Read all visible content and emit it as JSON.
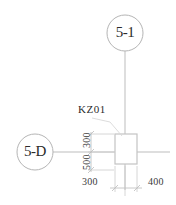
{
  "drawing": {
    "title": "Structural column grid detail",
    "colors": {
      "line": "#b9b9b9",
      "line_light": "#cfcfcf",
      "text": "#2b2b2b",
      "background": "#ffffff"
    },
    "grid_bubbles": [
      {
        "id": "top",
        "label": "5-1",
        "axis": "vertical"
      },
      {
        "id": "left",
        "label": "5-D",
        "axis": "horizontal"
      }
    ],
    "column": {
      "tag": "KZ01",
      "shape": "square"
    },
    "dimensions": {
      "vertical": [
        {
          "value": "300",
          "position": "above-axis"
        },
        {
          "value": "500",
          "position": "below-axis"
        }
      ],
      "horizontal": [
        {
          "value": "300",
          "position": "left-of-axis"
        },
        {
          "value": "400",
          "position": "right-of-axis"
        }
      ]
    }
  }
}
